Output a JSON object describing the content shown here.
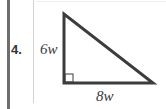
{
  "problem": {
    "number": "4.",
    "figure": {
      "shape": "right-triangle",
      "vertical_leg_label": "6w",
      "horizontal_leg_label": "8w",
      "right_angle_marker": true
    }
  }
}
